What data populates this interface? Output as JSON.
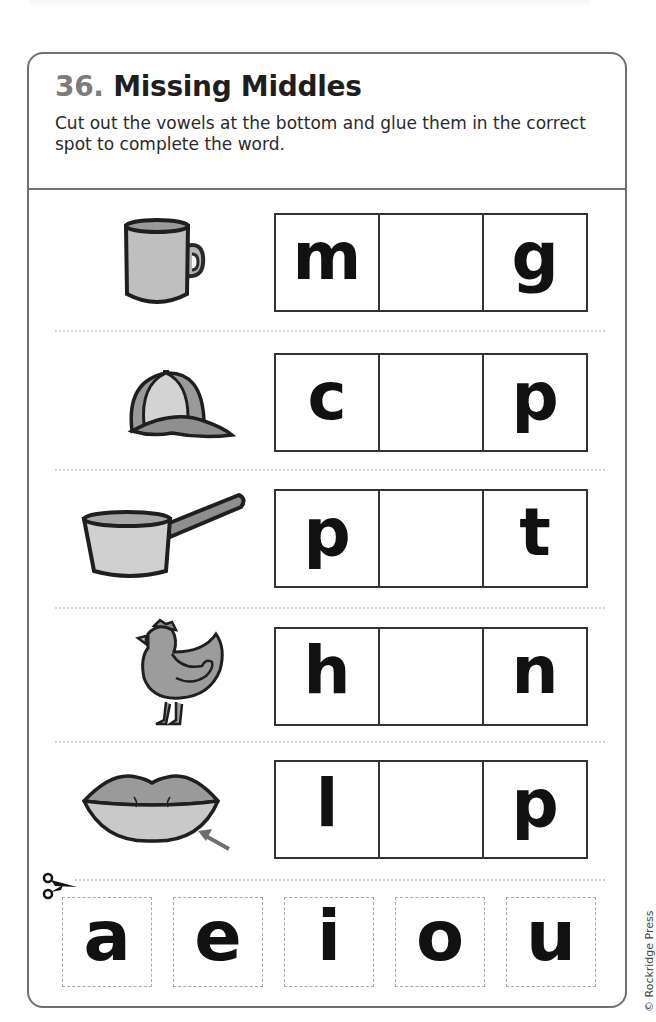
{
  "worksheet": {
    "number": "36.",
    "title": "Missing Middles",
    "instructions": "Cut out the vowels at the bottom and glue them in the correct spot to complete the word."
  },
  "rows": [
    {
      "picture": "mug-icon",
      "first": "m",
      "middle": "",
      "last": "g"
    },
    {
      "picture": "cap-icon",
      "first": "c",
      "middle": "",
      "last": "p"
    },
    {
      "picture": "pan-icon",
      "first": "p",
      "middle": "",
      "last": "t"
    },
    {
      "picture": "hen-icon",
      "first": "h",
      "middle": "",
      "last": "n"
    },
    {
      "picture": "lip-icon",
      "first": "l",
      "middle": "",
      "last": "p"
    }
  ],
  "cutouts": {
    "icon": "scissors-icon",
    "vowels": [
      "a",
      "e",
      "i",
      "o",
      "u"
    ]
  },
  "footer": {
    "copyright": "© Rockridge Press"
  },
  "colors": {
    "border": "#6f6f6f",
    "number": "#7c7c7c",
    "illustration_fill": "#a9a9a9",
    "illustration_light": "#cfcfcf",
    "outline": "#2a2a2a"
  }
}
